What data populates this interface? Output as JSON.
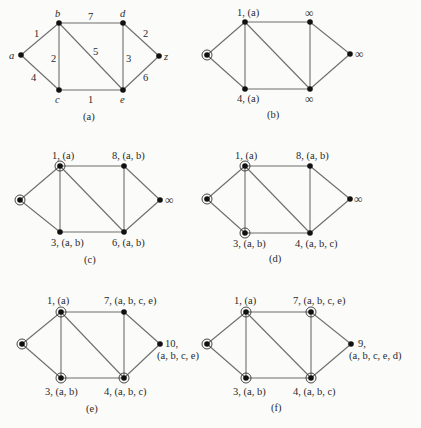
{
  "figure": {
    "graph": {
      "vertices": [
        "a",
        "b",
        "c",
        "d",
        "e",
        "z"
      ],
      "edges": [
        {
          "from": "a",
          "to": "b",
          "weight": "1"
        },
        {
          "from": "a",
          "to": "c",
          "weight": "4"
        },
        {
          "from": "b",
          "to": "c",
          "weight": "2"
        },
        {
          "from": "b",
          "to": "d",
          "weight": "7"
        },
        {
          "from": "b",
          "to": "e",
          "weight": "5"
        },
        {
          "from": "c",
          "to": "e",
          "weight": "1"
        },
        {
          "from": "d",
          "to": "e",
          "weight": "3"
        },
        {
          "from": "d",
          "to": "z",
          "weight": "2"
        },
        {
          "from": "e",
          "to": "z",
          "weight": "6"
        }
      ]
    },
    "panels": [
      {
        "id": "a",
        "caption": "(a)",
        "origin": [
          0,
          0
        ],
        "nodes": {
          "a": {
            "pos": [
              21,
              55
            ],
            "label": "a",
            "circled": false
          },
          "b": {
            "pos": [
              59,
              23
            ],
            "label": "b",
            "circled": false
          },
          "c": {
            "pos": [
              59,
              90
            ],
            "label": "c",
            "circled": false
          },
          "d": {
            "pos": [
              123,
              23
            ],
            "label": "d",
            "circled": false
          },
          "e": {
            "pos": [
              123,
              90
            ],
            "label": "e",
            "circled": false
          },
          "z": {
            "pos": [
              159,
              56
            ],
            "label": "z",
            "circled": false
          }
        }
      },
      {
        "id": "b",
        "caption": "(b)",
        "nodes": {
          "a": {
            "pos": [
              207,
              55
            ],
            "label": "",
            "circled": true
          },
          "b": {
            "pos": [
              245,
              22
            ],
            "label": "1, (a)",
            "circled": false
          },
          "c": {
            "pos": [
              245,
              89
            ],
            "label": "4, (a)",
            "circled": false
          },
          "d": {
            "pos": [
              310,
              22
            ],
            "label": "∞",
            "circled": false
          },
          "e": {
            "pos": [
              310,
              89
            ],
            "label": "∞",
            "circled": false
          },
          "z": {
            "pos": [
              350,
              54
            ],
            "label": "∞",
            "circled": false
          }
        }
      },
      {
        "id": "c",
        "caption": "(c)",
        "nodes": {
          "a": {
            "pos": [
              20,
              200
            ],
            "label": "",
            "circled": true
          },
          "b": {
            "pos": [
              60,
              166
            ],
            "label": "1, (a)",
            "circled": true
          },
          "c": {
            "pos": [
              60,
              232
            ],
            "label": "3, (a, b)",
            "circled": false
          },
          "d": {
            "pos": [
              124,
              166
            ],
            "label": "8, (a, b)",
            "circled": false
          },
          "e": {
            "pos": [
              124,
              232
            ],
            "label": "6, (a, b)",
            "circled": false
          },
          "z": {
            "pos": [
              160,
              200
            ],
            "label": "∞",
            "circled": false
          }
        }
      },
      {
        "id": "d",
        "caption": "(d)",
        "nodes": {
          "a": {
            "pos": [
              207,
              199
            ],
            "label": "",
            "circled": true
          },
          "b": {
            "pos": [
              245,
              166
            ],
            "label": "1, (a)",
            "circled": true
          },
          "c": {
            "pos": [
              245,
              233
            ],
            "label": "3, (a, b)",
            "circled": true
          },
          "d": {
            "pos": [
              310,
              166
            ],
            "label": "8, (a, b)",
            "circled": false
          },
          "e": {
            "pos": [
              310,
              233
            ],
            "label": "4, (a, b, c)",
            "circled": false
          },
          "z": {
            "pos": [
              350,
              199
            ],
            "label": "∞",
            "circled": false
          }
        }
      },
      {
        "id": "e",
        "caption": "(e)",
        "nodes": {
          "a": {
            "pos": [
              22,
              344
            ],
            "label": "",
            "circled": true
          },
          "b": {
            "pos": [
              61,
              312
            ],
            "label": "1, (a)",
            "circled": true
          },
          "c": {
            "pos": [
              61,
              378
            ],
            "label": "3, (a, b)",
            "circled": true
          },
          "d": {
            "pos": [
              124,
              312
            ],
            "label": "7, (a, b, c, e)",
            "circled": false
          },
          "e": {
            "pos": [
              124,
              378
            ],
            "label": "4, (a, b, c)",
            "circled": true
          },
          "z": {
            "pos": [
              160,
              344
            ],
            "label": "10, (a, b, c, e)",
            "circled": false
          }
        }
      },
      {
        "id": "f",
        "caption": "(f)",
        "nodes": {
          "a": {
            "pos": [
              207,
              344
            ],
            "label": "",
            "circled": true
          },
          "b": {
            "pos": [
              246,
              312
            ],
            "label": "1, (a)",
            "circled": true
          },
          "c": {
            "pos": [
              246,
              378
            ],
            "label": "3, (a, b)",
            "circled": true
          },
          "d": {
            "pos": [
              311,
              312
            ],
            "label": "7, (a, b, c, e)",
            "circled": true
          },
          "e": {
            "pos": [
              311,
              378
            ],
            "label": "4, (a, b, c)",
            "circled": true
          },
          "z": {
            "pos": [
              351,
              344
            ],
            "label": "9, (a, b, c, e, d)",
            "circled": false
          }
        }
      }
    ],
    "text": {
      "a": {
        "node_a": "a",
        "node_b": "b",
        "node_c": "c",
        "node_d": "d",
        "node_e": "e",
        "node_z": "z",
        "w_ab": "1",
        "w_ac": "4",
        "w_bc": "2",
        "w_bd": "7",
        "w_be": "5",
        "w_ce": "1",
        "w_de": "3",
        "w_dz": "2",
        "w_ez": "6",
        "caption": "(a)"
      },
      "b": {
        "b": "1, (a)",
        "c": "4, (a)",
        "d": "∞",
        "e": "∞",
        "z": "∞",
        "caption": "(b)"
      },
      "c": {
        "b": "1, (a)",
        "c": "3, (a, b)",
        "d": "8, (a, b)",
        "e": "6, (a, b)",
        "z": "∞",
        "caption": "(c)"
      },
      "d": {
        "b": "1, (a)",
        "c": "3, (a, b)",
        "d": "8, (a, b)",
        "e": "4, (a, b, c)",
        "z": "∞",
        "caption": "(d)"
      },
      "e": {
        "b": "1, (a)",
        "c": "3, (a, b)",
        "d": "7, (a, b, c, e)",
        "e": "4, (a, b, c)",
        "z1": "10,",
        "z2": "(a, b, c, e)",
        "caption": "(e)"
      },
      "f": {
        "b": "1, (a)",
        "c": "3, (a, b)",
        "d": "7, (a, b, c, e)",
        "e": "4, (a, b, c)",
        "z1": "9,",
        "z2": "(a, b, c, e, d)",
        "caption": "(f)"
      }
    }
  }
}
